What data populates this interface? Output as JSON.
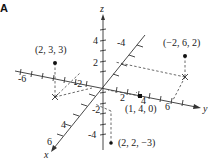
{
  "panel_label": "A",
  "axes": {
    "x": {
      "label": "x",
      "ticks": [
        {
          "value": "-4"
        },
        {
          "value": "-2"
        },
        {
          "value": "4"
        },
        {
          "value": "6"
        }
      ]
    },
    "y": {
      "label": "y",
      "ticks": [
        {
          "value": "-6"
        },
        {
          "value": "2"
        },
        {
          "value": "4"
        },
        {
          "value": "6"
        }
      ]
    },
    "z": {
      "label": "z",
      "ticks": [
        {
          "value": "4"
        },
        {
          "value": "2"
        },
        {
          "value": "-2"
        },
        {
          "value": "-4"
        }
      ]
    }
  },
  "points": [
    {
      "label": "(2,   3, 3)",
      "coords": [
        2,
        3,
        3
      ]
    },
    {
      "label": "(−2, 6, 2)",
      "coords": [
        -2,
        6,
        2
      ]
    },
    {
      "label": "(1, 4, 0)",
      "coords": [
        1,
        4,
        0
      ]
    },
    {
      "label": "(2, 2, −3)",
      "coords": [
        2,
        2,
        -3
      ]
    }
  ],
  "colors": {
    "ink": "#222222",
    "dash": "#444444",
    "background": "#ffffff"
  }
}
